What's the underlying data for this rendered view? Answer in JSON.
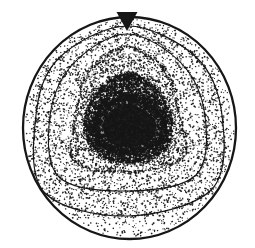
{
  "figure": {
    "width": 255,
    "height": 248,
    "colors": {
      "paper": "#ffffff",
      "ink": "#161616"
    },
    "seed": 1337,
    "boundary": {
      "cx": 129.5,
      "cy": 128,
      "rx": 106.5,
      "ry": 111,
      "strokeWidth": 2.3
    },
    "marker": {
      "points": [
        [
          116.5,
          12
        ],
        [
          137.5,
          12
        ],
        [
          127,
          31
        ]
      ]
    },
    "contours": [
      {
        "name": "t1",
        "style": "solid",
        "strokeWidth": 1.15,
        "lineDots": 340,
        "sigma": 1.1,
        "pts": [
          [
            127,
            26
          ],
          [
            196,
            57
          ],
          [
            222,
            115
          ],
          [
            212,
            189
          ],
          [
            127,
            216
          ],
          [
            44,
            192
          ],
          [
            36,
            115
          ],
          [
            59,
            58
          ]
        ]
      },
      {
        "name": "t2",
        "style": "solid",
        "strokeWidth": 1.05,
        "lineDots": 320,
        "sigma": 1.0,
        "pts": [
          [
            127,
            34
          ],
          [
            182,
            64
          ],
          [
            205,
            116
          ],
          [
            196,
            175
          ],
          [
            128,
            191
          ],
          [
            59,
            177
          ],
          [
            50,
            116
          ],
          [
            73,
            64
          ]
        ]
      },
      {
        "name": "t3",
        "style": "dotted",
        "strokeWidth": 0,
        "lineDots": 560,
        "sigma": 1.0,
        "pts": [
          [
            127,
            47
          ],
          [
            166,
            71
          ],
          [
            179,
            116
          ],
          [
            183,
            158
          ],
          [
            128,
            172
          ],
          [
            74,
            161
          ],
          [
            76,
            116
          ],
          [
            89,
            71
          ]
        ]
      },
      {
        "name": "t4",
        "style": "dotted",
        "strokeWidth": 0,
        "lineDots": 680,
        "sigma": 1.7,
        "pts": [
          [
            128,
            73
          ],
          [
            155,
            88
          ],
          [
            171,
            117
          ],
          [
            166,
            149
          ],
          [
            128,
            163
          ],
          [
            95,
            151
          ],
          [
            85,
            117
          ],
          [
            101,
            88
          ]
        ]
      }
    ],
    "core": {
      "outer": {
        "pts": [
          [
            128,
            97
          ],
          [
            152,
            107
          ],
          [
            163,
            122
          ],
          [
            158,
            143
          ],
          [
            130,
            152
          ],
          [
            104,
            146
          ],
          [
            95,
            124
          ],
          [
            106,
            106
          ]
        ],
        "fillAlpha": 0.5,
        "edgeDots": 1500,
        "edgeSigma": 2.6
      },
      "inner": {
        "pts": [
          [
            129,
            104
          ],
          [
            148,
            113
          ],
          [
            156,
            124
          ],
          [
            151,
            140
          ],
          [
            130,
            147
          ],
          [
            110,
            142
          ],
          [
            103,
            124
          ],
          [
            112,
            110
          ]
        ],
        "fillAlpha": 0.94
      }
    },
    "stipple": {
      "dot": {
        "rMin": 0.45,
        "rMax": 0.95,
        "alpha": 0.92
      },
      "layers": [
        {
          "name": "base-field",
          "region": "boundary",
          "exclude": null,
          "count": 3000
        },
        {
          "name": "outer-band",
          "region": "t1",
          "exclude": "t3",
          "count": 950
        },
        {
          "name": "mid-band",
          "region": "t3",
          "exclude": "t4",
          "count": 950
        },
        {
          "name": "ring",
          "region": "t4",
          "exclude": "core-outer",
          "count": 2900,
          "rMin": 0.5,
          "rMax": 1.15
        },
        {
          "name": "core-grain",
          "region": "core-outer",
          "exclude": null,
          "count": 1700,
          "rMin": 0.5,
          "rMax": 1.2
        }
      ]
    }
  }
}
